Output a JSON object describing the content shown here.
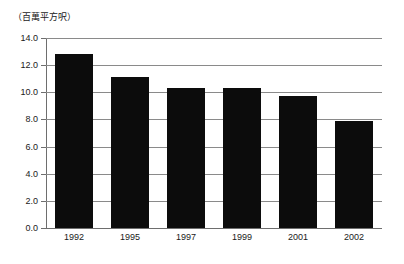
{
  "chart_data": {
    "type": "bar",
    "title": "",
    "subtitle": "",
    "unit_caption": "（百萬平方呎）",
    "xlabel": "",
    "ylabel": "",
    "categories": [
      "1992",
      "1995",
      "1997",
      "1999",
      "2001",
      "2002"
    ],
    "values": [
      12.8,
      11.1,
      10.3,
      10.3,
      9.7,
      7.9
    ],
    "series": [
      {
        "name": "",
        "values": [
          12.8,
          11.1,
          10.3,
          10.3,
          9.7,
          7.9
        ]
      }
    ],
    "ylim": [
      0.0,
      14.0
    ],
    "ytick_step": 2.0,
    "ytick_labels": [
      "14.0",
      "12.0",
      "10.0",
      "8.0",
      "6.0",
      "4.0",
      "2.0",
      "0.0"
    ],
    "ytick_values": [
      14.0,
      12.0,
      10.0,
      8.0,
      6.0,
      4.0,
      2.0,
      0.0
    ],
    "grid": true,
    "grid_axis": "y",
    "legend": false,
    "legend_position": "none",
    "bar_color": "#0c0c0c",
    "grid_color": "#8a8a8a",
    "axis_color": "#6e6e6e",
    "background_color": "#ffffff"
  }
}
